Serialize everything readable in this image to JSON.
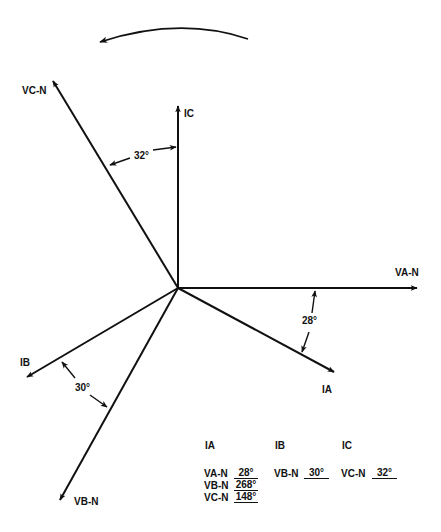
{
  "diagram": {
    "title": "",
    "rotation_direction": "counter-clockwise",
    "origin": [
      178,
      288
    ],
    "phasors": [
      {
        "id": "VA-N",
        "label": "VA-N",
        "angle_deg": 0,
        "tip": [
          419,
          288
        ],
        "label_pos": [
          395,
          276
        ]
      },
      {
        "id": "IA",
        "label": "IA",
        "angle_deg": -28,
        "tip": [
          336,
          373
        ],
        "label_pos": [
          322,
          393
        ]
      },
      {
        "id": "IC",
        "label": "IC",
        "angle_deg": 90,
        "tip": [
          178,
          104
        ],
        "label_pos": [
          184,
          116
        ]
      },
      {
        "id": "VC-N",
        "label": "VC-N",
        "angle_deg": 122,
        "tip": [
          52,
          79
        ],
        "label_pos": [
          22,
          94
        ]
      },
      {
        "id": "IB",
        "label": "IB",
        "angle_deg": 210,
        "tip": [
          25,
          378
        ],
        "label_pos": [
          20,
          366
        ]
      },
      {
        "id": "VB-N",
        "label": "VB-N",
        "angle_deg": 240,
        "tip": [
          59,
          502
        ],
        "label_pos": [
          74,
          505
        ]
      }
    ],
    "angle_annotations": [
      {
        "label": "28°",
        "between": [
          "VA-N",
          "IA"
        ],
        "pos": [
          302,
          324
        ]
      },
      {
        "label": "30°",
        "between": [
          "IB",
          "VB-N"
        ],
        "pos": [
          75,
          391
        ]
      },
      {
        "label": "32°",
        "between": [
          "IC",
          "VC-N"
        ],
        "pos": [
          134,
          159
        ]
      }
    ]
  },
  "table": {
    "columns": [
      {
        "header": "IA",
        "rows": [
          {
            "ref": "VA-N",
            "value": "28°"
          },
          {
            "ref": "VB-N",
            "value": "268°"
          },
          {
            "ref": "VC-N",
            "value": "148°"
          }
        ]
      },
      {
        "header": "IB",
        "rows": [
          {
            "ref": "VB-N",
            "value": "30°"
          }
        ]
      },
      {
        "header": "IC",
        "rows": [
          {
            "ref": "VC-N",
            "value": "32°"
          }
        ]
      }
    ]
  }
}
